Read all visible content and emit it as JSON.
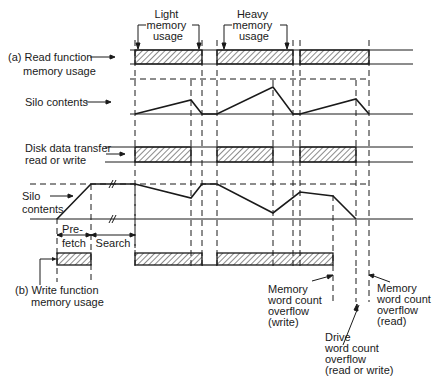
{
  "diagram": {
    "annotations": {
      "light_memory": [
        "Light",
        "memory",
        "usage"
      ],
      "heavy_memory": [
        "Heavy",
        "memory",
        "usage"
      ]
    },
    "rows": {
      "read_function": [
        "(a) Read function",
        "memory usage"
      ],
      "silo_contents_a": "Silo contents",
      "disk_transfer": [
        "Disk data transfer",
        "read or write"
      ],
      "silo_contents_b": [
        "Silo",
        "contents"
      ],
      "prefetch": [
        "Pre-",
        "fetch"
      ],
      "search": "Search",
      "write_function": [
        "(b) Write function",
        "memory usage"
      ]
    },
    "events": {
      "mem_overflow_write": [
        "Memory",
        "word count",
        "overflow",
        "(write)"
      ],
      "drive_overflow": [
        "Drive",
        "word count",
        "overflow",
        "(read or write)"
      ],
      "mem_overflow_read": [
        "Memory",
        "word count",
        "overflow",
        "(read)"
      ]
    },
    "colors": {
      "ink": "#1a1a1a",
      "background": "#ffffff"
    }
  }
}
